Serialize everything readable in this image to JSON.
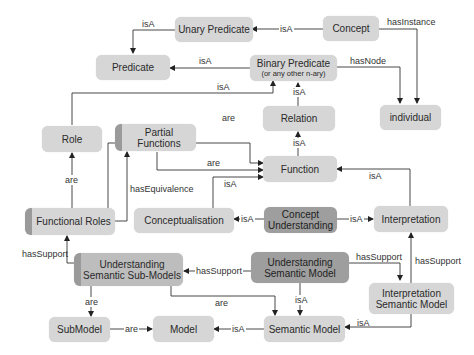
{
  "nodes": {
    "unary_predicate": "Unary Predicate",
    "concept": "Concept",
    "predicate": "Predicate",
    "binary_predicate": "Binary Predicate",
    "binary_predicate_sub": "(or any other n-ary)",
    "individual": "individual",
    "relation": "Relation",
    "role": "Role",
    "partial_functions": "Partial Functions",
    "function": "Function",
    "functional_roles": "Functional Roles",
    "conceptualisation": "Conceptualisation",
    "concept_understanding_1": "Concept",
    "concept_understanding_2": "Understanding",
    "interpretation": "Interpretation",
    "usub_1": "Understanding",
    "usub_2": "Semantic Sub-Models",
    "usm_1": "Understanding",
    "usm_2": "Semantic Model",
    "ism_1": "Interpretation",
    "ism_2": "Semantic Model",
    "submodel": "SubModel",
    "model": "Model",
    "semantic_model": "Semantic Model"
  },
  "edges": {
    "unary_to_predicate": "isA",
    "concept_to_unary": "isA",
    "concept_to_individual": "hasInstance",
    "binary_to_predicate": "isA",
    "binary_to_individual": "hasNode",
    "role_to_binary": "isA",
    "relation_to_binary": "isA",
    "function_to_relation": "isA",
    "functional_roles_to_function": "are",
    "partial_to_function": "are",
    "conceptualisation_to_function": "isA",
    "interpretation_to_function": "isA",
    "functional_roles_to_role": "are",
    "functional_roles_to_partial": "hasEquivalence",
    "cu_to_conceptualisation": "isA",
    "cu_to_interpretation": "isA",
    "usub_to_functional_roles": "hasSupport",
    "usm_to_usub": "hasSupport",
    "usm_to_ism": "hasSupport",
    "ism_to_interpretation": "hasSupport",
    "usub_to_submodel": "are",
    "usub_to_semantic_model": "are",
    "usm_to_semantic_model": "isA",
    "ism_to_semantic_model": "isA",
    "submodel_to_model": "are",
    "semantic_model_to_model": "isA"
  }
}
